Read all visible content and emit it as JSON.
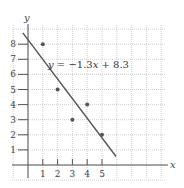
{
  "chart_data": {
    "type": "scatter",
    "title": "",
    "xlabel": "x",
    "ylabel": "y",
    "x_ticks": [
      "1",
      "2",
      "3",
      "4",
      "5"
    ],
    "y_ticks": [
      "1",
      "2",
      "3",
      "4",
      "5",
      "6",
      "7",
      "8"
    ],
    "xlim": [
      -1,
      9
    ],
    "ylim": [
      -1,
      9
    ],
    "grid": true,
    "series": [
      {
        "name": "data points",
        "type": "scatter",
        "x": [
          1,
          2,
          3,
          4,
          5
        ],
        "y": [
          8,
          5,
          3,
          4,
          2
        ]
      },
      {
        "name": "regression line",
        "type": "line",
        "equation": "y = −1.3x + 8.3",
        "slope": -1.3,
        "intercept": 8.3
      }
    ],
    "annotations": [
      {
        "text": "y = −1.3x + 8.3",
        "position": [
          1.1,
          7.3
        ]
      }
    ]
  },
  "labels": {
    "x_axis": "x",
    "y_axis": "y",
    "equation_y": "y",
    "equation_rest": " = −1.3",
    "equation_x": "x",
    "equation_tail": " + 8.3"
  },
  "colors": {
    "grid": "#b0b0b0",
    "axis": "#555555",
    "line": "#555555",
    "point": "#555555"
  }
}
